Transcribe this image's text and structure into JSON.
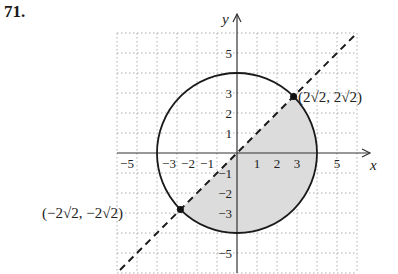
{
  "problem": {
    "number": "71."
  },
  "diagram": {
    "axes": {
      "x_label": "x",
      "y_label": "y"
    },
    "x_ticks": [
      {
        "value": -5,
        "label": "−5"
      },
      {
        "value": -3,
        "label": "−3"
      },
      {
        "value": -2,
        "label": "−2"
      },
      {
        "value": -1,
        "label": "−1"
      },
      {
        "value": 1,
        "label": "1"
      },
      {
        "value": 2,
        "label": "2"
      },
      {
        "value": 3,
        "label": "3"
      },
      {
        "value": 5,
        "label": "5"
      }
    ],
    "y_ticks": [
      {
        "value": 5,
        "label": "5"
      },
      {
        "value": 3,
        "label": "3"
      },
      {
        "value": 2,
        "label": "2"
      },
      {
        "value": 1,
        "label": "1"
      },
      {
        "value": -1,
        "label": "−1"
      },
      {
        "value": -2,
        "label": "−2"
      },
      {
        "value": -3,
        "label": "−3"
      },
      {
        "value": -5,
        "label": "−5"
      }
    ],
    "grid": {
      "min": -6,
      "max": 6,
      "step": 1,
      "style": "dotted"
    },
    "circle": {
      "center": [
        0,
        0
      ],
      "radius": 4,
      "style": "solid"
    },
    "line": {
      "equation": "y = x",
      "style": "dashed"
    },
    "shaded_region": "inside circle, below line y = x",
    "points": [
      {
        "label": "(2√2, 2√2)",
        "x": 2.828,
        "y": 2.828
      },
      {
        "label": "(−2√2, −2√2)",
        "x": -2.828,
        "y": -2.828
      }
    ],
    "colors": {
      "shade": "#dcdcdc",
      "stroke": "#1a1a1a",
      "grid": "#9a9a9a"
    }
  }
}
